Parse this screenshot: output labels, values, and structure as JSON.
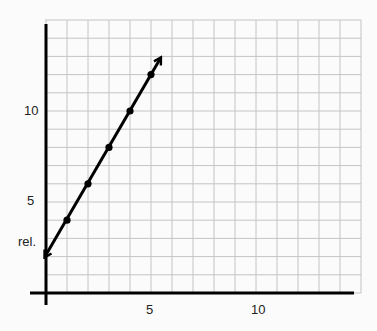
{
  "chart_data": {
    "type": "line",
    "title": "",
    "xlabel": "",
    "ylabel": "",
    "annotation": "rel.",
    "xlim": [
      -0.8,
      15
    ],
    "ylim": [
      -0.7,
      15
    ],
    "grid": true,
    "grid_step": {
      "x": 1,
      "y": 1
    },
    "x_tick_labels": [
      {
        "value": 5,
        "label": "5"
      },
      {
        "value": 10,
        "label": "10"
      }
    ],
    "y_tick_labels": [
      {
        "value": 5,
        "label": "5"
      },
      {
        "value": 10,
        "label": "10"
      }
    ],
    "series": [
      {
        "name": "line",
        "x": [
          0,
          1,
          2,
          3,
          4,
          5
        ],
        "y": [
          2,
          4,
          6,
          8,
          10,
          12
        ],
        "markers_at": [
          1,
          2,
          3,
          4,
          5
        ],
        "arrows": "both",
        "arrow_end": [
          5.45,
          12.9
        ]
      }
    ],
    "legend": null
  },
  "colors": {
    "background": "#fbfbfb",
    "grid": "#c4c4c4",
    "axis": "#000000",
    "line": "#000000"
  },
  "labels": {
    "y_annotation": "rel.",
    "x5": "5",
    "x10": "10",
    "y5": "5",
    "y10": "10"
  }
}
